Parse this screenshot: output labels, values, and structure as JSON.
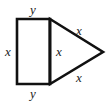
{
  "figure": {
    "stroke_color": "#111111",
    "fill_color": "#ffffff",
    "background_color": "#ffffff",
    "stroke_width": 2.6,
    "width_px": 111,
    "height_px": 103,
    "shapes": [
      {
        "name": "rectangle",
        "points": "17,19 50,19 50,84 17,84"
      },
      {
        "name": "triangle",
        "points": "50,19 103,52 50,84"
      },
      {
        "name": "shared-edge",
        "points": "50,19 50,84"
      }
    ],
    "labels": [
      {
        "id": "top",
        "text": "y",
        "x": 33,
        "y": 9,
        "edge": "rectangle-top"
      },
      {
        "id": "left",
        "text": "x",
        "x": 8,
        "y": 51,
        "edge": "rectangle-left"
      },
      {
        "id": "bottom",
        "text": "y",
        "x": 33,
        "y": 93,
        "edge": "rectangle-bottom"
      },
      {
        "id": "middle",
        "text": "x",
        "x": 59,
        "y": 51,
        "edge": "shared-vertical"
      },
      {
        "id": "upper-slant",
        "text": "x",
        "x": 79,
        "y": 30,
        "edge": "triangle-upper"
      },
      {
        "id": "lower-slant",
        "text": "x",
        "x": 79,
        "y": 77,
        "edge": "triangle-lower"
      }
    ]
  }
}
